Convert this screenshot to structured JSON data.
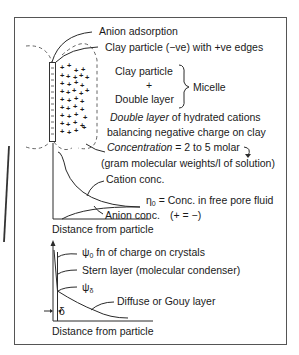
{
  "diagram": {
    "top_section": {
      "anion_adsorption": "Anion adsorption",
      "clay_particle_edges": "Clay particle (−ve) with +ve edges",
      "micelle_clay_particle": "Clay particle",
      "micelle_plus": "+",
      "micelle_double_layer": "Double layer",
      "micelle_label": "Micelle",
      "double_layer_italic": "Double layer",
      "double_layer_rest": " of hydrated cations",
      "balancing": "balancing negative charge on clay",
      "concentration_italic": "Concentration",
      "concentration_rest": " = 2 to 5 molar",
      "gram_molecular": "(gram molecular weights/l of solution)"
    },
    "middle_plot": {
      "cation_conc": "Cation conc.",
      "eta0_symbol": "η",
      "eta0_sub": "0",
      "eta0_text": " = Conc. in free pore fluid",
      "anion_conc": "Anion conc.",
      "equal_note": "(+ = −)",
      "xlabel": "Distance from particle"
    },
    "bottom_plot": {
      "psi0_symbol": "ψ",
      "psi0_sub": "0",
      "psi0_text": " fn of charge on crystals",
      "stern_layer": "Stern layer (molecular condenser)",
      "psi_delta_symbol": "ψ",
      "psi_delta_sub": "δ",
      "diffuse_layer": "Diffuse or Gouy layer",
      "delta": "δ",
      "xlabel": "Distance from particle"
    }
  }
}
